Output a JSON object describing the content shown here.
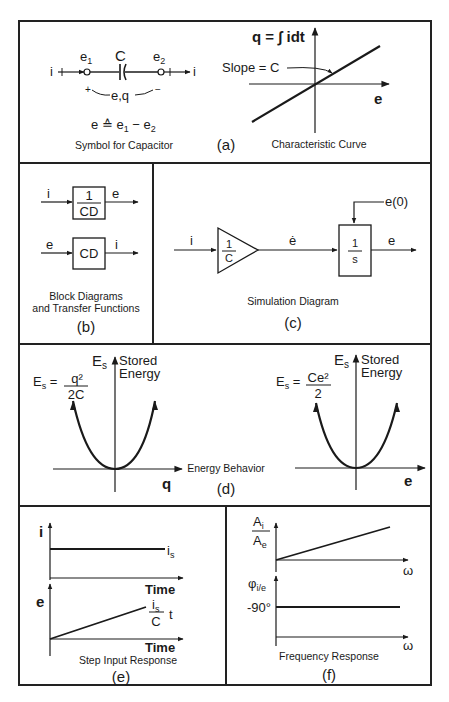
{
  "panels": {
    "a": {
      "tag": "(a)",
      "symbol": {
        "caption": "Symbol for Capacitor",
        "element_label": "C",
        "node1": "e",
        "node1_sub": "1",
        "node2": "e",
        "node2_sub": "2",
        "current_in": "i",
        "current_out": "i",
        "plus": "+",
        "minus": "−",
        "variables": "e,q",
        "definition_lhs": "e ≙ e",
        "definition_sub1": "1",
        "definition_mid": " − e",
        "definition_sub2": "2"
      },
      "curve": {
        "caption": "Characteristic Curve",
        "y_label": "q = ∫ idt",
        "x_label": "e",
        "annotation": "Slope = C"
      }
    },
    "b": {
      "tag": "(b)",
      "caption_line1": "Block Diagrams",
      "caption_line2": "and Transfer Functions",
      "block1": {
        "input": "i",
        "num": "1",
        "den": "CD",
        "output": "e"
      },
      "block2": {
        "input": "e",
        "tf": "CD",
        "output": "i"
      }
    },
    "c": {
      "tag": "(c)",
      "caption": "Simulation Diagram",
      "input": "i",
      "gain_num": "1",
      "gain_den": "C",
      "mid_signal": "ė",
      "integrator_num": "1",
      "integrator_den": "s",
      "output": "e",
      "initial_condition": "e(0)"
    },
    "d": {
      "tag": "(d)",
      "caption": "Energy Behavior",
      "left": {
        "lhs": "E",
        "lhs_sub": "s",
        "num": "q²",
        "den": "2C",
        "axis_y": "E",
        "axis_y_sub": "s",
        "axis_y_note1": "Stored",
        "axis_y_note2": "Energy",
        "axis_x": "q"
      },
      "right": {
        "lhs": "E",
        "lhs_sub": "s",
        "num": "Ce²",
        "den": "2",
        "axis_y": "E",
        "axis_y_sub": "s",
        "axis_y_note1": "Stored",
        "axis_y_note2": "Energy",
        "axis_x": "e"
      }
    },
    "e": {
      "tag": "(e)",
      "caption": "Step Input Response",
      "top": {
        "y_label": "i",
        "x_label": "Time",
        "level": "i",
        "level_sub": "s"
      },
      "bottom": {
        "y_label": "e",
        "x_label": "Time",
        "ramp_num": "i",
        "ramp_num_sub": "s",
        "ramp_den": "C",
        "ramp_t": "t"
      }
    },
    "f": {
      "tag": "(f)",
      "caption": "Frequency Response",
      "top": {
        "y_num": "A",
        "y_num_sub": "i",
        "y_den": "A",
        "y_den_sub": "e",
        "x_label": "ω"
      },
      "bottom": {
        "y_label": "φ",
        "y_sub": "i/e",
        "level": "-90°",
        "x_label": "ω"
      }
    }
  }
}
